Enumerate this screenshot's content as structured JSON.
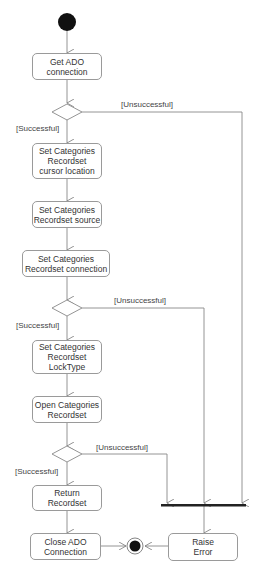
{
  "diagram": {
    "type": "UML activity diagram",
    "nodes": {
      "get_ado_connection": "Get ADO\nconnection",
      "set_cursor_location": "Set Categories\nRecordset\ncursor location",
      "set_source": "Set Categories\nRecordset source",
      "set_connection": "Set Categories\nRecordset connection",
      "set_locktype": "Set Categories\nRecordset\nLockType",
      "open_recordset": "Open Categories\nRecordset",
      "return_recordset": "Return\nRecordset",
      "close_ado_connection": "Close ADO\nConnection",
      "raise_error": "Raise\nError"
    },
    "guards": {
      "success_1": "[Successful]",
      "fail_1": "[Unsuccessful]",
      "success_2": "[Successful]",
      "fail_2": "[Unsuccessful]",
      "success_3": "[Successful]",
      "fail_3": "[Unsuccessful]"
    }
  }
}
